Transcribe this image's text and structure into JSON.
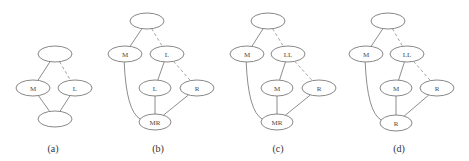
{
  "figure": {
    "panels": [
      {
        "id": "a",
        "caption": "(a)",
        "caption_pos": [
          53,
          148
        ],
        "nodes": [
          {
            "id": "top",
            "label": "",
            "x": 55,
            "y": 54,
            "rx": 17,
            "ry": 8
          },
          {
            "id": "M",
            "label": "M",
            "x": 33,
            "y": 88,
            "rx": 17,
            "ry": 8
          },
          {
            "id": "L",
            "label": "L",
            "x": 75,
            "y": 88,
            "rx": 17,
            "ry": 8
          },
          {
            "id": "bottom",
            "label": "",
            "x": 55,
            "y": 119,
            "rx": 17,
            "ry": 8
          }
        ],
        "edges": [
          {
            "from": "top",
            "to": "M",
            "style": "solid"
          },
          {
            "from": "top",
            "to": "L",
            "style": "dashed"
          },
          {
            "from": "M",
            "to": "bottom",
            "style": "solid"
          },
          {
            "from": "L",
            "to": "bottom",
            "style": "solid"
          }
        ]
      },
      {
        "id": "b",
        "caption": "(b)",
        "caption_pos": [
          158,
          148
        ],
        "nodes": [
          {
            "id": "top",
            "label": "",
            "x": 147,
            "y": 21,
            "rx": 17,
            "ry": 8
          },
          {
            "id": "M",
            "label": "M",
            "x": 125,
            "y": 54,
            "rx": 17,
            "ry": 8
          },
          {
            "id": "L",
            "label": "L",
            "x": 167,
            "y": 54,
            "rx": 17,
            "ry": 8
          },
          {
            "id": "L2",
            "label": "L",
            "x": 155,
            "y": 88,
            "rx": 16,
            "ry": 8
          },
          {
            "id": "R",
            "label": "R",
            "x": 197,
            "y": 88,
            "rx": 17,
            "ry": 8
          },
          {
            "id": "MR",
            "label": "MR",
            "x": 155,
            "y": 122,
            "rx": 16,
            "ry": 8
          }
        ],
        "edges": [
          {
            "from": "top",
            "to": "M",
            "style": "solid"
          },
          {
            "from": "top",
            "to": "L",
            "style": "dashed"
          },
          {
            "from": "L",
            "to": "L2",
            "style": "solid"
          },
          {
            "from": "L",
            "to": "R",
            "style": "dashed"
          },
          {
            "from": "L2",
            "to": "MR",
            "style": "solid"
          },
          {
            "from": "R",
            "to": "MR",
            "style": "solid"
          },
          {
            "from": "M",
            "to": "MR",
            "style": "curve"
          }
        ]
      },
      {
        "id": "c",
        "caption": "(c)",
        "caption_pos": [
          278,
          148
        ],
        "nodes": [
          {
            "id": "top",
            "label": "",
            "x": 268,
            "y": 21,
            "rx": 17,
            "ry": 8
          },
          {
            "id": "M",
            "label": "M",
            "x": 247,
            "y": 54,
            "rx": 17,
            "ry": 8
          },
          {
            "id": "LL",
            "label": "LL",
            "x": 288,
            "y": 54,
            "rx": 17,
            "ry": 8
          },
          {
            "id": "M2",
            "label": "M",
            "x": 277,
            "y": 88,
            "rx": 16,
            "ry": 8
          },
          {
            "id": "R",
            "label": "R",
            "x": 319,
            "y": 88,
            "rx": 17,
            "ry": 8
          },
          {
            "id": "MR",
            "label": "MR",
            "x": 277,
            "y": 122,
            "rx": 16,
            "ry": 8
          }
        ],
        "edges": [
          {
            "from": "top",
            "to": "M",
            "style": "solid"
          },
          {
            "from": "top",
            "to": "LL",
            "style": "dashed"
          },
          {
            "from": "LL",
            "to": "M2",
            "style": "solid"
          },
          {
            "from": "LL",
            "to": "R",
            "style": "dashed"
          },
          {
            "from": "M2",
            "to": "MR",
            "style": "solid"
          },
          {
            "from": "R",
            "to": "MR",
            "style": "solid"
          },
          {
            "from": "M",
            "to": "MR",
            "style": "curve"
          }
        ]
      },
      {
        "id": "d",
        "caption": "(d)",
        "caption_pos": [
          399,
          148
        ],
        "nodes": [
          {
            "id": "top",
            "label": "",
            "x": 388,
            "y": 21,
            "rx": 17,
            "ry": 8
          },
          {
            "id": "M",
            "label": "M",
            "x": 366,
            "y": 54,
            "rx": 17,
            "ry": 8
          },
          {
            "id": "LL",
            "label": "LL",
            "x": 407,
            "y": 54,
            "rx": 17,
            "ry": 8
          },
          {
            "id": "M2",
            "label": "M",
            "x": 396,
            "y": 88,
            "rx": 16,
            "ry": 8
          },
          {
            "id": "R",
            "label": "R",
            "x": 437,
            "y": 88,
            "rx": 17,
            "ry": 8
          },
          {
            "id": "Rb",
            "label": "R",
            "x": 396,
            "y": 123,
            "rx": 16,
            "ry": 8
          }
        ],
        "edges": [
          {
            "from": "top",
            "to": "M",
            "style": "solid"
          },
          {
            "from": "top",
            "to": "LL",
            "style": "dashed"
          },
          {
            "from": "LL",
            "to": "M2",
            "style": "solid"
          },
          {
            "from": "LL",
            "to": "R",
            "style": "dashed"
          },
          {
            "from": "M2",
            "to": "Rb",
            "style": "solid"
          },
          {
            "from": "R",
            "to": "Rb",
            "style": "solid"
          },
          {
            "from": "M",
            "to": "Rb",
            "style": "curve"
          }
        ]
      }
    ]
  }
}
